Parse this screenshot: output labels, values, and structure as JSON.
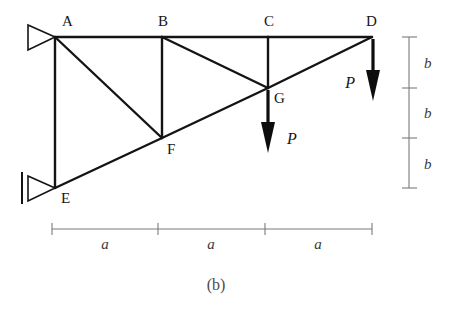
{
  "figure": {
    "caption": "(b)",
    "background_color": "#ffffff",
    "line_color": "#141414",
    "dimension_color": "#7a7a7a"
  },
  "nodes": [
    {
      "id": "A",
      "label": "A",
      "x": 55,
      "y": 37,
      "label_x": 62,
      "label_y": 26
    },
    {
      "id": "B",
      "label": "B",
      "x": 162,
      "y": 37,
      "label_x": 158,
      "label_y": 26
    },
    {
      "id": "C",
      "label": "C",
      "x": 268,
      "y": 37,
      "label_x": 264,
      "label_y": 26
    },
    {
      "id": "D",
      "label": "D",
      "x": 372,
      "y": 37,
      "label_x": 366,
      "label_y": 26
    },
    {
      "id": "E",
      "label": "E",
      "x": 55,
      "y": 188,
      "label_x": 61,
      "label_y": 203
    },
    {
      "id": "F",
      "label": "F",
      "x": 162,
      "y": 138,
      "label_x": 167,
      "label_y": 154
    },
    {
      "id": "G",
      "label": "G",
      "x": 268,
      "y": 88,
      "label_x": 274,
      "label_y": 103
    }
  ],
  "members": [
    {
      "name": "top-chord-A-B",
      "from": "A",
      "to": "B"
    },
    {
      "name": "top-chord-B-C",
      "from": "B",
      "to": "C"
    },
    {
      "name": "top-chord-C-D",
      "from": "C",
      "to": "D"
    },
    {
      "name": "bottom-chord-E-F",
      "from": "E",
      "to": "F"
    },
    {
      "name": "bottom-chord-F-G",
      "from": "F",
      "to": "G"
    },
    {
      "name": "bottom-chord-G-D",
      "from": "G",
      "to": "D"
    },
    {
      "name": "vertical-A-E",
      "from": "A",
      "to": "E"
    },
    {
      "name": "vertical-B-F",
      "from": "B",
      "to": "F"
    },
    {
      "name": "vertical-C-G",
      "from": "C",
      "to": "G"
    },
    {
      "name": "diagonal-A-F",
      "from": "A",
      "to": "F"
    },
    {
      "name": "diagonal-B-G",
      "from": "B",
      "to": "G"
    }
  ],
  "supports": [
    {
      "name": "pin-support-A",
      "at": "A",
      "type": "pin-triangle-right",
      "has_wall": false
    },
    {
      "name": "pin-support-E",
      "at": "E",
      "type": "pin-triangle-right",
      "has_wall": true
    }
  ],
  "loads": [
    {
      "name": "load-at-G",
      "label": "P",
      "at": "G",
      "direction": "down",
      "x": 268,
      "y_start": 90,
      "y_end": 152,
      "label_x": 287,
      "label_y": 144
    },
    {
      "name": "load-at-D",
      "label": "P",
      "at": "D",
      "direction": "down",
      "x": 373,
      "y_start": 39,
      "y_end": 100,
      "label_x": 355,
      "label_y": 88
    }
  ],
  "dimensions": {
    "horizontal": {
      "name": "span-dimension",
      "y": 229,
      "ticks": [
        52,
        158,
        265,
        372
      ],
      "segments": [
        {
          "label": "a",
          "label_x": 105,
          "label_y": 249
        },
        {
          "label": "a",
          "label_x": 211,
          "label_y": 249
        },
        {
          "label": "a",
          "label_x": 318,
          "label_y": 249
        }
      ]
    },
    "vertical": {
      "name": "height-dimension",
      "x": 409,
      "ticks": [
        37,
        88,
        138,
        188
      ],
      "segments": [
        {
          "label": "b",
          "label_x": 424,
          "label_y": 68
        },
        {
          "label": "b",
          "label_x": 424,
          "label_y": 118
        },
        {
          "label": "b",
          "label_x": 424,
          "label_y": 169
        }
      ]
    }
  },
  "caption": {
    "text": "(b)",
    "x": 216,
    "y": 290
  }
}
